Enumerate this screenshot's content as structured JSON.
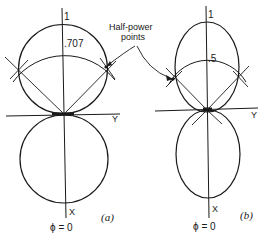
{
  "diagram": {
    "annotation": {
      "text_line1": "Half-power",
      "text_line2": "points"
    },
    "panel_a": {
      "caption": "(a)",
      "top_label": "1",
      "level_label": ".707",
      "y_axis_label": "Y",
      "x_axis_label": "X",
      "phi_label": "ϕ = 0"
    },
    "panel_b": {
      "caption": "(b)",
      "top_label": "1",
      "level_label": ".5",
      "y_axis_label": "Y",
      "x_axis_label": "X",
      "phi_label": "ϕ = 0"
    }
  }
}
